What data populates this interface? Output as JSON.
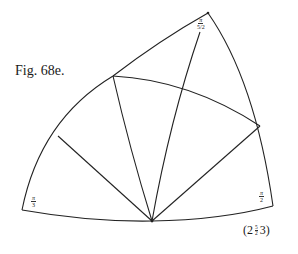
{
  "figure": {
    "label": "Fig. 68e.",
    "caption": {
      "open": "(2",
      "frac_num": "5",
      "frac_den": "2",
      "close": "3)"
    },
    "corner_labels": {
      "top": {
        "num": "π",
        "den": "5/2"
      },
      "bottom_left": {
        "num": "π",
        "den": "3"
      },
      "bottom_right": {
        "num": "π",
        "den": "2"
      }
    },
    "stroke_color": "#222222",
    "background": "#ffffff"
  }
}
